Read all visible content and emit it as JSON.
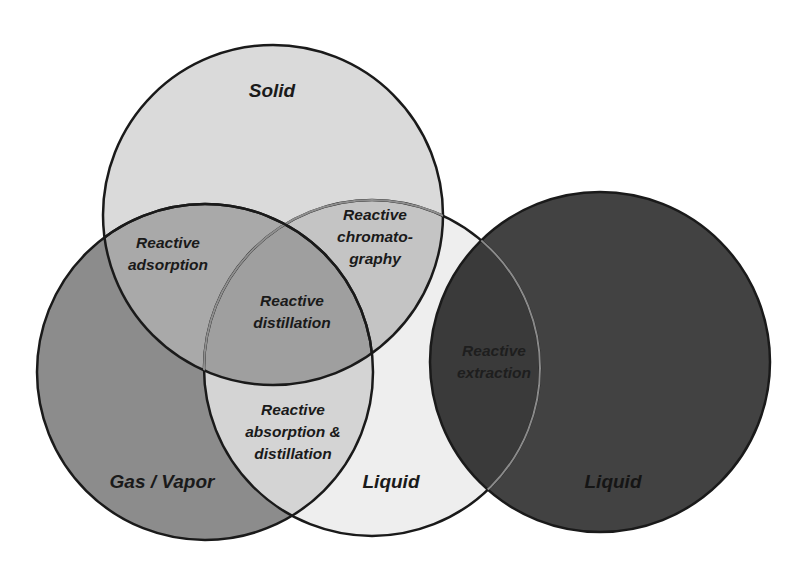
{
  "diagram": {
    "type": "venn",
    "title": "",
    "circles": [
      {
        "id": "solid",
        "label": "Solid",
        "cx": 273,
        "cy": 215,
        "r": 170,
        "fill": "#d9d9d9",
        "stroke": "#1a1a1a"
      },
      {
        "id": "gas",
        "label": "Gas / Vapor",
        "cx": 205,
        "cy": 372,
        "r": 168,
        "fill": "#8a8a8a",
        "stroke": "#1a1a1a"
      },
      {
        "id": "liquid1",
        "label": "Liquid",
        "cx": 372,
        "cy": 368,
        "r": 168,
        "fill": "#ececec",
        "stroke": "#1a1a1a"
      },
      {
        "id": "liquid2",
        "label": "Liquid",
        "cx": 600,
        "cy": 362,
        "r": 170,
        "fill": "#404040",
        "stroke": "#1a1a1a"
      }
    ],
    "regions": {
      "solid": "Solid",
      "gas": "Gas / Vapor",
      "liquid1": "Liquid",
      "liquid2": "Liquid",
      "adsorption": [
        "Reactive",
        "adsorption"
      ],
      "distillation": [
        "Reactive",
        "distillation"
      ],
      "chromatography": [
        "Reactive",
        "chromato-",
        "graphy"
      ],
      "absorption": [
        "Reactive",
        "absorption &",
        "distillation"
      ],
      "extraction": [
        "Reactive",
        "extraction"
      ]
    },
    "intersections": [
      {
        "sets": [
          "Solid",
          "Gas / Vapor"
        ],
        "label": "Reactive adsorption"
      },
      {
        "sets": [
          "Solid",
          "Gas / Vapor",
          "Liquid"
        ],
        "label": "Reactive distillation"
      },
      {
        "sets": [
          "Solid",
          "Liquid"
        ],
        "label": "Reactive chromatography"
      },
      {
        "sets": [
          "Gas / Vapor",
          "Liquid"
        ],
        "label": "Reactive absorption & distillation"
      },
      {
        "sets": [
          "Liquid",
          "Liquid"
        ],
        "label": "Reactive extraction"
      }
    ]
  }
}
